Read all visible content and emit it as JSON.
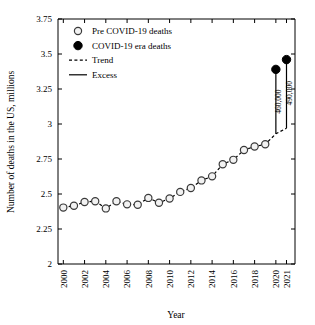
{
  "chart_data": {
    "type": "scatter",
    "title": "",
    "xlabel": "Year",
    "ylabel": "Number of deaths in the US, millions",
    "xlim": [
      1999.5,
      2021.8
    ],
    "ylim": [
      2,
      3.75
    ],
    "grid": false,
    "legend_position": "top-left",
    "y_ticks": [
      "2",
      "2.25",
      "2.5",
      "2.75",
      "3",
      "3.25",
      "3.5",
      "3.75"
    ],
    "y_tick_values": [
      2,
      2.25,
      2.5,
      2.75,
      3,
      3.25,
      3.5,
      3.75
    ],
    "x_ticks": [
      "2000",
      "2002",
      "2004",
      "2006",
      "2008",
      "2010",
      "2012",
      "2014",
      "2016",
      "2018",
      "2020",
      "2021"
    ],
    "x_tick_values": [
      2000,
      2002,
      2004,
      2006,
      2008,
      2010,
      2012,
      2014,
      2016,
      2018,
      2020,
      2021
    ],
    "series": [
      {
        "name": "Pre COVID-19 deaths",
        "marker": "open-circle",
        "x": [
          2000,
          2001,
          2002,
          2003,
          2004,
          2005,
          2006,
          2007,
          2008,
          2009,
          2010,
          2011,
          2012,
          2013,
          2014,
          2015,
          2016,
          2017,
          2018,
          2019
        ],
        "values": [
          2.403,
          2.416,
          2.443,
          2.448,
          2.397,
          2.448,
          2.426,
          2.423,
          2.472,
          2.437,
          2.468,
          2.515,
          2.543,
          2.597,
          2.626,
          2.713,
          2.744,
          2.814,
          2.839,
          2.855
        ]
      },
      {
        "name": "COVID-19 era deaths",
        "marker": "filled-circle",
        "x": [
          2020,
          2021
        ],
        "values": [
          3.39,
          3.46
        ]
      }
    ],
    "trend": {
      "name": "Trend",
      "style": "dashed",
      "x": [
        2000,
        2001,
        2002,
        2003,
        2004,
        2005,
        2006,
        2007,
        2008,
        2009,
        2010,
        2011,
        2012,
        2013,
        2014,
        2015,
        2016,
        2017,
        2018,
        2019,
        2020,
        2021
      ],
      "values": [
        2.403,
        2.416,
        2.443,
        2.448,
        2.397,
        2.448,
        2.426,
        2.423,
        2.472,
        2.437,
        2.468,
        2.515,
        2.543,
        2.597,
        2.626,
        2.713,
        2.744,
        2.814,
        2.839,
        2.855,
        2.93,
        2.97
      ]
    },
    "excess": {
      "name": "Excess",
      "style": "solid",
      "segments": [
        {
          "x": 2020,
          "y0": 2.93,
          "y1": 3.39,
          "label": "460,000"
        },
        {
          "x": 2021,
          "y0": 2.97,
          "y1": 3.46,
          "label": "490,000"
        }
      ]
    },
    "annotations": [
      {
        "text": "460,000",
        "x": 2020,
        "y": 3.16,
        "rotation": -90
      },
      {
        "text": "490,000",
        "x": 2021,
        "y": 3.22,
        "rotation": -90
      }
    ]
  },
  "legend": {
    "items": [
      {
        "label": "Pre COVID-19 deaths",
        "marker": "open-circle"
      },
      {
        "label": "COVID-19 era deaths",
        "marker": "filled-circle"
      },
      {
        "label": "Trend",
        "marker": "dashed-line"
      },
      {
        "label": "Excess",
        "marker": "solid-line"
      }
    ]
  },
  "colors": {
    "axis": "#000000",
    "marker_face_pre": "#f2f2f2",
    "marker_edge_pre": "#3a3a3a",
    "marker_covid": "#000000",
    "background": "#ffffff"
  }
}
